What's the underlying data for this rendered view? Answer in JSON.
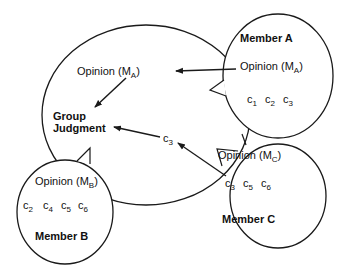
{
  "diagram": {
    "group": {
      "label_line1": "Group",
      "label_line2": "Judgment",
      "opinion_text": "Opinion (M",
      "opinion_sub": "A",
      "opinion_close": ")"
    },
    "members": [
      {
        "name": "Member A",
        "opinion_text": "Opinion (M",
        "opinion_sub": "A",
        "opinion_close": ")",
        "cues": [
          {
            "c": "c",
            "sub": "1"
          },
          {
            "c": "c",
            "sub": "2"
          },
          {
            "c": "c",
            "sub": "3"
          }
        ]
      },
      {
        "name": "Member B",
        "opinion_text": "Opinion (M",
        "opinion_sub": "B",
        "opinion_close": ")",
        "cues": [
          {
            "c": "c",
            "sub": "2"
          },
          {
            "c": "c",
            "sub": "4"
          },
          {
            "c": "c",
            "sub": "5"
          },
          {
            "c": "c",
            "sub": "6"
          }
        ]
      },
      {
        "name": "Member C",
        "opinion_text": "Opinion (M",
        "opinion_sub": "C",
        "opinion_close": ")",
        "cues": [
          {
            "c": "c",
            "sub": "3"
          },
          {
            "c": "c",
            "sub": "5"
          },
          {
            "c": "c",
            "sub": "6"
          }
        ]
      }
    ],
    "shared_cue": {
      "c": "c",
      "sub": "3"
    },
    "edges": [
      {
        "from": "Member A opinion",
        "to": "Group opinion (M_A)"
      },
      {
        "from": "Group opinion (M_A)",
        "to": "Group Judgment"
      },
      {
        "from": "Member C cue c3",
        "to": "shared cue c3"
      },
      {
        "from": "shared cue c3",
        "to": "Group Judgment"
      }
    ],
    "colors": {
      "stroke": "#1a1a1a",
      "text": "#111111",
      "background": "#ffffff"
    }
  }
}
